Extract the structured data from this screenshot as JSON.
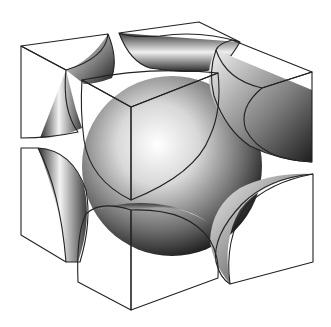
{
  "figure": {
    "title": "Body-centered cubic unit cell",
    "colors": {
      "background": "#ffffff",
      "shaded_face": "#b8b8b8",
      "light_face": "#ffffff",
      "outline": "#222222",
      "sphere_light": "#ffffff",
      "sphere_dark": "#1a1a1a"
    },
    "components": [
      {
        "name": "center-sphere",
        "type": "sphere"
      },
      {
        "name": "corner-back-left-top",
        "type": "octant"
      },
      {
        "name": "corner-back-middle-top",
        "type": "octant"
      },
      {
        "name": "corner-right-top",
        "type": "octant"
      },
      {
        "name": "corner-front-top",
        "type": "octant"
      },
      {
        "name": "corner-left-bottom",
        "type": "octant"
      },
      {
        "name": "corner-front-bottom",
        "type": "octant"
      },
      {
        "name": "corner-right-bottom",
        "type": "octant"
      }
    ]
  }
}
